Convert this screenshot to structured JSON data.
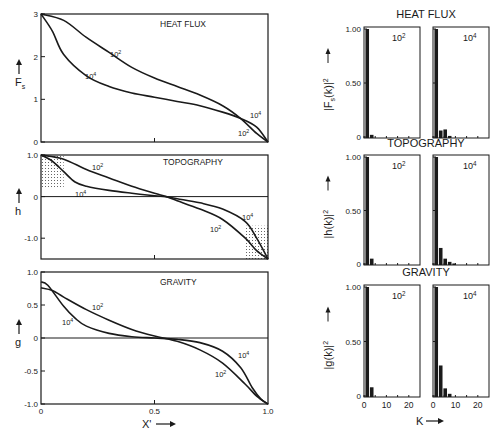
{
  "chart_data": [
    {
      "type": "line",
      "title": "HEAT FLUX",
      "xlabel": "X'",
      "ylabel": "Fs",
      "xlim": [
        0,
        1.0
      ],
      "ylim": [
        0,
        3
      ],
      "yticks": [
        "0",
        "1",
        "2",
        "3"
      ],
      "series": [
        {
          "name": "10^2",
          "x": [
            0,
            0.1,
            0.2,
            0.3,
            0.4,
            0.5,
            0.6,
            0.7,
            0.8,
            0.88,
            0.95,
            1.0
          ],
          "y": [
            3.0,
            2.85,
            2.45,
            2.1,
            1.75,
            1.5,
            1.3,
            1.1,
            0.85,
            0.55,
            0.2,
            0.0
          ]
        },
        {
          "name": "10^4",
          "x": [
            0,
            0.05,
            0.1,
            0.2,
            0.3,
            0.4,
            0.5,
            0.6,
            0.7,
            0.8,
            0.88,
            0.95,
            1.0
          ],
          "y": [
            3.0,
            2.6,
            2.05,
            1.55,
            1.3,
            1.15,
            1.05,
            0.95,
            0.85,
            0.7,
            0.55,
            0.35,
            0.0
          ]
        }
      ],
      "annotations": [
        "10^2",
        "10^4",
        "10^4",
        "10^2"
      ]
    },
    {
      "type": "line",
      "title": "TOPOGRAPHY",
      "xlabel": "X'",
      "ylabel": "h",
      "xlim": [
        0,
        1.0
      ],
      "ylim": [
        -1.5,
        1.0
      ],
      "yticks": [
        "1.0",
        "0",
        "-1.0"
      ],
      "series": [
        {
          "name": "10^2",
          "x": [
            0,
            0.1,
            0.2,
            0.3,
            0.4,
            0.5,
            0.55,
            0.6,
            0.7,
            0.8,
            0.9,
            0.95,
            1.0
          ],
          "y": [
            1.0,
            0.9,
            0.65,
            0.45,
            0.25,
            0.08,
            0.0,
            -0.1,
            -0.3,
            -0.55,
            -1.0,
            -1.3,
            -1.5
          ]
        },
        {
          "name": "10^4",
          "x": [
            0,
            0.05,
            0.1,
            0.15,
            0.2,
            0.3,
            0.4,
            0.5,
            0.55,
            0.6,
            0.7,
            0.8,
            0.9,
            0.95,
            1.0
          ],
          "y": [
            1.0,
            0.85,
            0.6,
            0.35,
            0.25,
            0.15,
            0.08,
            0.02,
            0.0,
            -0.05,
            -0.15,
            -0.3,
            -0.6,
            -1.0,
            -1.5
          ]
        }
      ],
      "shading": "dotted regions near x=0 (0 to 0.8) and x=1 (-0.8 to -1.5)"
    },
    {
      "type": "line",
      "title": "GRAVITY",
      "xlabel": "X'",
      "ylabel": "g",
      "xlim": [
        0,
        1.0
      ],
      "ylim": [
        -1.0,
        1.0
      ],
      "yticks": [
        "1.0",
        "0.5",
        "0",
        "-0.5",
        "-1.0"
      ],
      "xticks": [
        "0",
        "0.5",
        "1.0"
      ],
      "series": [
        {
          "name": "10^2",
          "x": [
            0,
            0.05,
            0.1,
            0.2,
            0.3,
            0.4,
            0.5,
            0.6,
            0.7,
            0.8,
            0.9,
            0.95,
            1.0
          ],
          "y": [
            0.76,
            0.72,
            0.62,
            0.43,
            0.27,
            0.13,
            0.03,
            -0.05,
            -0.18,
            -0.38,
            -0.7,
            -0.88,
            -1.0
          ]
        },
        {
          "name": "10^4",
          "x": [
            0,
            0.03,
            0.1,
            0.15,
            0.2,
            0.3,
            0.4,
            0.5,
            0.6,
            0.7,
            0.8,
            0.88,
            0.93,
            0.97,
            1.0
          ],
          "y": [
            0.85,
            0.8,
            0.48,
            0.3,
            0.18,
            0.07,
            0.02,
            0.0,
            -0.02,
            -0.07,
            -0.2,
            -0.45,
            -0.75,
            -0.93,
            -1.0
          ]
        }
      ]
    },
    {
      "type": "bar",
      "title": "HEAT FLUX",
      "ylabel": "|Fs(k)|^2",
      "xlabel": "K",
      "ylim": [
        0,
        1.0
      ],
      "yticks": [
        "0",
        "0.50",
        "1.00"
      ],
      "xticks": [
        "0",
        "10",
        "20"
      ],
      "panels": [
        {
          "name": "10^2",
          "k": [
            1,
            3,
            5
          ],
          "values": [
            1.0,
            0.02,
            0.0
          ]
        },
        {
          "name": "10^4",
          "k": [
            1,
            3,
            5,
            7
          ],
          "values": [
            1.0,
            0.06,
            0.07,
            0.01
          ]
        }
      ]
    },
    {
      "type": "bar",
      "title": "TOPOGRAPHY",
      "ylabel": "|h(k)|^2",
      "xlabel": "K",
      "ylim": [
        0,
        1.0
      ],
      "yticks": [
        "0",
        "0.50",
        "1.00"
      ],
      "xticks": [
        "0",
        "10",
        "20"
      ],
      "panels": [
        {
          "name": "10^2",
          "k": [
            1,
            3
          ],
          "values": [
            1.0,
            0.05
          ]
        },
        {
          "name": "10^4",
          "k": [
            1,
            3,
            5,
            7,
            9
          ],
          "values": [
            1.0,
            0.15,
            0.05,
            0.02,
            0.005
          ]
        }
      ]
    },
    {
      "type": "bar",
      "title": "GRAVITY",
      "ylabel": "|g(k)|^2",
      "xlabel": "K",
      "ylim": [
        0,
        1.0
      ],
      "yticks": [
        "0",
        "0.50",
        "1.00"
      ],
      "xticks": [
        "0",
        "10",
        "20"
      ],
      "panels": [
        {
          "name": "10^2",
          "k": [
            1,
            3
          ],
          "values": [
            1.0,
            0.08
          ]
        },
        {
          "name": "10^4",
          "k": [
            1,
            3,
            5,
            7
          ],
          "values": [
            1.0,
            0.28,
            0.07,
            0.02
          ]
        }
      ]
    }
  ],
  "labels": {
    "left_titles": [
      "HEAT FLUX",
      "TOPOGRAPHY",
      "GRAVITY"
    ],
    "right_titles": [
      "HEAT FLUX",
      "TOPOGRAPHY",
      "GRAVITY"
    ],
    "left_ylabels": [
      "F",
      "h",
      "g"
    ],
    "fs_sub": "s",
    "right_ylabels": [
      "|F",
      "|h(k)|",
      "|g(k)|"
    ],
    "x_axis": "X'",
    "k_axis": "K",
    "ra_low": "10",
    "ra_low_exp": "2",
    "ra_high": "10",
    "ra_high_exp": "4"
  }
}
